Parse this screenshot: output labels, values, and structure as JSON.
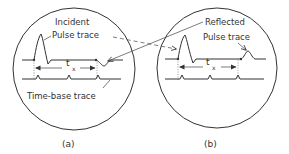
{
  "figure": {
    "colors": {
      "ink": "#333333",
      "background": "#ffffff"
    },
    "panel_a": {
      "caption": "(a)",
      "label_incident": "Incident",
      "label_pulse_trace": "Pulse trace",
      "label_time_base": "Time-base trace",
      "interval_label": "t",
      "interval_subscript": "x"
    },
    "panel_b": {
      "caption": "(b)",
      "label_reflected": "Reflected",
      "label_pulse_trace": "Pulse trace",
      "interval_label": "t",
      "interval_subscript": "x"
    }
  }
}
